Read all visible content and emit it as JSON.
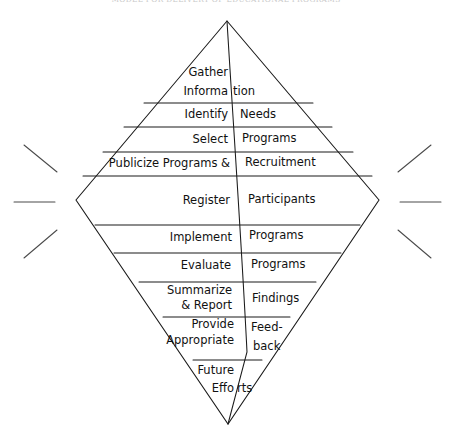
{
  "page": {
    "running_head": "MODEL FOR DELIVERY OF EDUCATIONAL PROGRAMS",
    "page_number": "",
    "background_color": "#ffffff",
    "ink_color": "#111111"
  },
  "diagram": {
    "name": "diamond-process-model",
    "shape": "diamond",
    "vertices": {
      "top": {
        "x": 227,
        "y": 21
      },
      "left": {
        "x": 76,
        "y": 200
      },
      "right": {
        "x": 379,
        "y": 200
      },
      "bottom": {
        "x": 228,
        "y": 424
      }
    },
    "sparkle_lines": {
      "left": [
        "diagonal-up",
        "horizontal",
        "diagonal-down"
      ],
      "right": [
        "diagonal-up",
        "horizontal",
        "diagonal-down"
      ]
    },
    "bands": [
      {
        "index": 0,
        "left_text": "Gather\nInformation",
        "right_text": "",
        "y_top": 21,
        "y_bottom": 103
      },
      {
        "index": 1,
        "left_text": "Identify",
        "right_text": "Needs",
        "y_top": 103,
        "y_bottom": 127
      },
      {
        "index": 2,
        "left_text": "Select",
        "right_text": "Programs",
        "y_top": 127,
        "y_bottom": 152
      },
      {
        "index": 3,
        "left_text": "Publicize Programs &",
        "right_text": "Recruitment",
        "y_top": 152,
        "y_bottom": 176
      },
      {
        "index": 4,
        "left_text": "Register",
        "right_text": "Participants",
        "y_top": 176,
        "y_bottom": 225
      },
      {
        "index": 5,
        "left_text": "Implement",
        "right_text": "Programs",
        "y_top": 225,
        "y_bottom": 253
      },
      {
        "index": 6,
        "left_text": "Evaluate",
        "right_text": "Programs",
        "y_top": 253,
        "y_bottom": 282
      },
      {
        "index": 7,
        "left_text": "Summarize\n& Report",
        "right_text": "Findings",
        "y_top": 282,
        "y_bottom": 317
      },
      {
        "index": 8,
        "left_text": "Provide\nAppropriate",
        "right_text": "Feed-\nback",
        "y_top": 317,
        "y_bottom": 360
      },
      {
        "index": 9,
        "left_text": "Future\nEfforts",
        "right_text": "",
        "y_top": 360,
        "y_bottom": 424
      }
    ]
  },
  "labels": {
    "b0_left_line1": "Gather",
    "b0_left_line2": "Informa",
    "b0_right_line2": "tion",
    "b1_left": "Identify",
    "b1_right": "Needs",
    "b2_left": "Select",
    "b2_right": "Programs",
    "b3_left": "Publicize Programs &",
    "b3_right": "Recruitment",
    "b4_left": "Register",
    "b4_right": "Participants",
    "b5_left": "Implement",
    "b5_right": "Programs",
    "b6_left": "Evaluate",
    "b6_right": "Programs",
    "b7_left_line1": "Summarize",
    "b7_left_line2": "& Report",
    "b7_right": "Findings",
    "b8_left_line1": "Provide",
    "b8_left_line2": "Appropriate",
    "b8_right_line1": "Feed-",
    "b8_right_line2": "back",
    "b9_left_line1": "Future",
    "b9_left_line2": "Effo",
    "b9_right_line2": "rts"
  }
}
